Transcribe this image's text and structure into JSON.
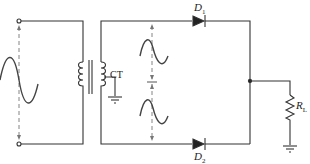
{
  "diagram": {
    "title": "",
    "type": "full-wave center-tapped rectifier",
    "labels": {
      "d1": "D",
      "d1_sub": "1",
      "d2": "D",
      "d2_sub": "2",
      "ct": "CT",
      "rl": "R",
      "rl_sub": "L"
    },
    "components": [
      {
        "id": "input-source",
        "kind": "ac-input-terminals"
      },
      {
        "id": "transformer",
        "kind": "center-tapped-transformer",
        "label": "CT"
      },
      {
        "id": "d1",
        "kind": "diode",
        "label": "D1"
      },
      {
        "id": "d2",
        "kind": "diode",
        "label": "D2"
      },
      {
        "id": "rl",
        "kind": "resistor",
        "label": "RL"
      },
      {
        "id": "gnd-ct",
        "kind": "ground"
      },
      {
        "id": "gnd-load",
        "kind": "ground"
      }
    ],
    "colors": {
      "line": "#333333",
      "dashed": "#777777",
      "background": "#ffffff"
    }
  }
}
